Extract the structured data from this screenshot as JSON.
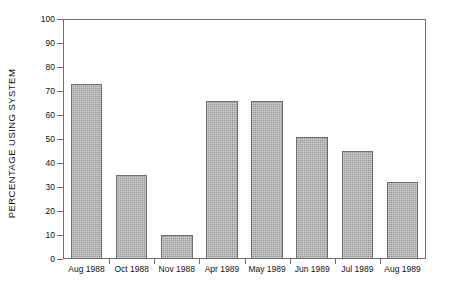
{
  "chart_data": {
    "type": "bar",
    "title": "",
    "subtitle": "",
    "xlabel": "",
    "ylabel": "PERCENTAGE USING SYSTEM",
    "categories": [
      "Aug 1988",
      "Oct 1988",
      "Nov 1988",
      "Apr 1989",
      "May 1989",
      "Jun 1989",
      "Jul 1989",
      "Aug 1989"
    ],
    "values": [
      73,
      35,
      10,
      66,
      66,
      51,
      45,
      32
    ],
    "ylim": [
      0,
      100
    ],
    "ytick_labels": [
      "100",
      "90",
      "80",
      "70",
      "60",
      "50",
      "40",
      "30",
      "20",
      "10",
      "0"
    ],
    "ytick_values": [
      100,
      90,
      80,
      70,
      60,
      50,
      40,
      30,
      20,
      10,
      0
    ],
    "grid": false,
    "legend": false,
    "legend_position": "none",
    "bar_fill_color": "#9a9a9a",
    "bar_edge_color": "#6e6e6e",
    "axis_color": "#6f6f6f",
    "background_color": "#ffffff",
    "text_color": "#111111"
  }
}
